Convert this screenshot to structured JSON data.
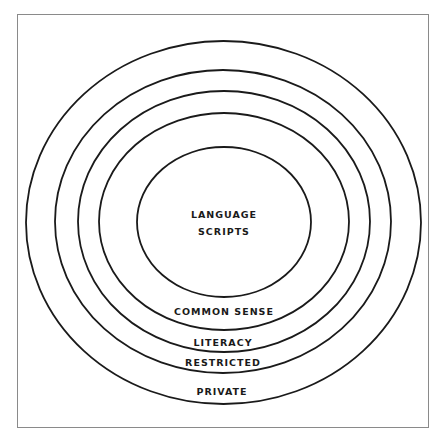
{
  "diagram": {
    "type": "concentric-ellipses",
    "line_color": "#1a1a1a",
    "frame_color": "#8a8a8a",
    "rings": [
      {
        "id": "private",
        "label": "PRIVATE",
        "cx": 223.5,
        "cy": 222.5,
        "rx": 197.5,
        "ry": 181.5,
        "label_y": 395
      },
      {
        "id": "restricted",
        "label": "RESTRICTED",
        "cx": 223,
        "cy": 221.5,
        "rx": 168,
        "ry": 151.5,
        "label_y": 366
      },
      {
        "id": "literacy",
        "label": "LITERACY",
        "cx": 224,
        "cy": 221.5,
        "rx": 146,
        "ry": 130.5,
        "label_y": 345
      },
      {
        "id": "common-sense",
        "label": "COMMON SENSE",
        "cx": 224,
        "cy": 221.5,
        "rx": 125,
        "ry": 108.5,
        "label_y": 315
      },
      {
        "id": "language-scripts",
        "label_lines": [
          "LANGUAGE",
          "SCRIPTS"
        ],
        "cx": 224,
        "cy": 222,
        "rx": 87,
        "ry": 75,
        "label_y": [
          218,
          235
        ]
      }
    ]
  }
}
